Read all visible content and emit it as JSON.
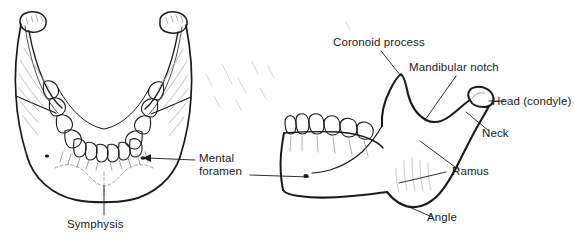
{
  "figure": {
    "background_color": "#ffffff",
    "ink_color": "#1a1a1a",
    "shading_color": "#9a9a9a",
    "width": 574,
    "height": 241
  },
  "views": [
    {
      "name": "anterior-mandible",
      "description": "Anterior (front) view of the mandible with teeth"
    },
    {
      "name": "lateral-mandible",
      "description": "Lateral (side) view of the right half of the mandible with teeth"
    }
  ],
  "labels": {
    "coronoid_process": "Coronoid process",
    "mandibular_notch": "Mandibular notch",
    "head_condyle": "Head (condyle)",
    "neck": "Neck",
    "ramus": "Ramus",
    "angle": "Angle",
    "mental_foramen": "Mental\nforamen",
    "symphysis": "Symphysis"
  }
}
